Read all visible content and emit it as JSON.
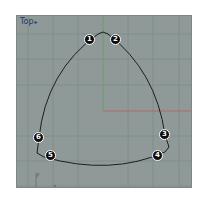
{
  "viewport": {
    "title": "Top",
    "menu_arrow": "▸",
    "background": "#8f9a98",
    "grid_color": "#7f8a88",
    "x_axis_color": "#b06a66",
    "y_axis_color": "#6f9a72",
    "curve_color": "#1e1e1e"
  },
  "callouts": [
    {
      "label": "1",
      "x": 89,
      "y": 39
    },
    {
      "label": "2",
      "x": 115,
      "y": 39
    },
    {
      "label": "3",
      "x": 164,
      "y": 134
    },
    {
      "label": "4",
      "x": 157,
      "y": 155
    },
    {
      "label": "5",
      "x": 50,
      "y": 155
    },
    {
      "label": "6",
      "x": 38,
      "y": 137
    }
  ],
  "axis_icon": {
    "y_label": "y",
    "x_label": "x"
  }
}
